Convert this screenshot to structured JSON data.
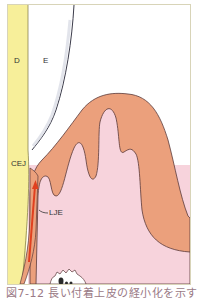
{
  "figure": {
    "labels": {
      "dentin": "D",
      "enamel": "E",
      "cej": "CEJ",
      "long_junctional_epithelium": "LJE"
    },
    "caption": "図7-12 長い付着上皮の経小化を示す",
    "colors": {
      "dentin": "#f7ef9a",
      "dentin_edge": "#e2d86a",
      "enamel": "#ffffff",
      "gingiva_outer": "#eba07c",
      "gingiva_inner": "#f7d3dc",
      "tissue_background": "#f7d3dc",
      "epithelium_arrow": "#e0401f",
      "outline": "#5a3a3a",
      "frame": "#d8d4b8"
    }
  }
}
